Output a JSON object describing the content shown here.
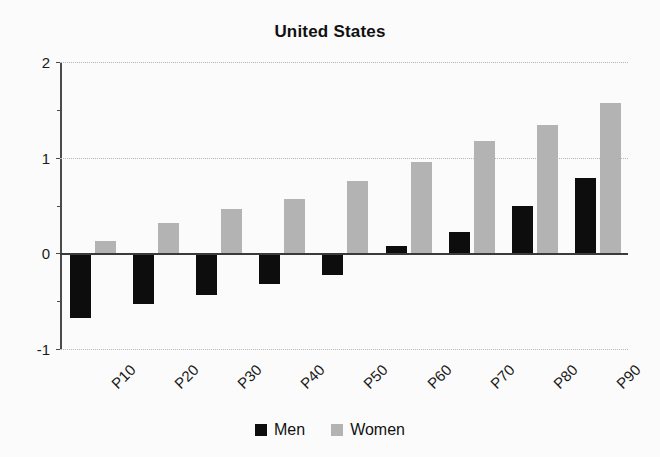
{
  "chart_data": {
    "type": "bar",
    "title": "United States",
    "xlabel": "",
    "ylabel": "",
    "categories": [
      "P10",
      "P20",
      "P30",
      "P40",
      "P50",
      "P60",
      "P70",
      "P80",
      "P90"
    ],
    "series": [
      {
        "name": "Men",
        "color": "#0d0d0d",
        "values": [
          -0.68,
          -0.53,
          -0.44,
          -0.32,
          -0.23,
          0.08,
          0.22,
          0.5,
          0.79
        ]
      },
      {
        "name": "Women",
        "color": "#b3b3b3",
        "values": [
          0.13,
          0.32,
          0.46,
          0.57,
          0.76,
          0.95,
          1.17,
          1.34,
          1.57
        ]
      }
    ],
    "ylim": [
      -1,
      2
    ],
    "yticks": [
      2,
      1,
      0,
      -1
    ],
    "ytick_labels": [
      "2",
      "1",
      "0",
      "-1"
    ],
    "yticks_minor": [
      1.5,
      0.5,
      -0.5
    ],
    "grid": true,
    "gridlines_at": [
      2,
      1,
      -1
    ],
    "zero_line": 0,
    "legend_position": "bottom",
    "legend": [
      "Men",
      "Women"
    ],
    "xlabel_rotation": -45
  },
  "legend": {
    "men_label": "Men",
    "women_label": "Women"
  }
}
